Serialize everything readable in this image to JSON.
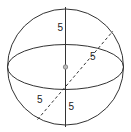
{
  "diagram": {
    "labels": {
      "upper_radius": "5",
      "dashed_upper_radius": "5",
      "dashed_lower_radius": "5",
      "lower_radius": "5"
    },
    "colors": {
      "stroke": "#333333",
      "center_dot": "#999999",
      "background": "#ffffff"
    }
  }
}
